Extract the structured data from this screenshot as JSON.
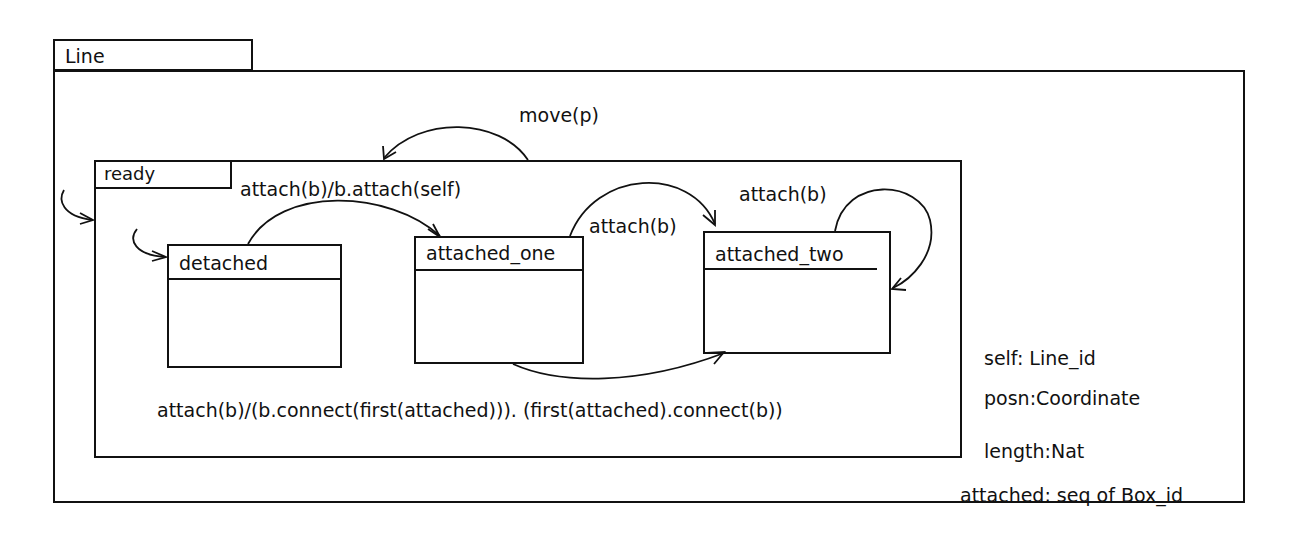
{
  "diagram": {
    "outer_state": {
      "name": "Line"
    },
    "ready_state": {
      "name": "ready"
    },
    "states": [
      {
        "id": "detached",
        "name": "detached"
      },
      {
        "id": "attached_one",
        "name": "attached_one"
      },
      {
        "id": "attached_two",
        "name": "attached_two"
      }
    ],
    "transitions": {
      "move": "move(p)",
      "detached_to_one": "attach(b)/b.attach(self)",
      "one_to_two": "attach(b)",
      "two_self": "attach(b)",
      "one_to_two_bottom": "attach(b)/(b.connect(first(attached))). (first(attached).connect(b))"
    },
    "attributes": [
      "self: Line_id",
      "posn:Coordinate",
      "length:Nat",
      "attached: seq of Box_id"
    ],
    "colors": {
      "line": "#111111",
      "background": "#ffffff"
    }
  }
}
